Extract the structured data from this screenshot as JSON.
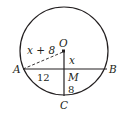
{
  "diagram": {
    "type": "circle-chord-geometry",
    "colors": {
      "stroke": "#231f20",
      "background": "#ffffff"
    },
    "points": {
      "O": {
        "label": "O"
      },
      "A": {
        "label": "A"
      },
      "B": {
        "label": "B"
      },
      "C": {
        "label": "C"
      },
      "M": {
        "label": "M"
      }
    },
    "segments": {
      "OA": {
        "label": "x + 8",
        "style": "dashed"
      },
      "OM": {
        "label": "x",
        "style": "solid"
      },
      "AM": {
        "label": "12",
        "style": "solid"
      },
      "MC": {
        "label": "8",
        "style": "solid"
      }
    }
  }
}
